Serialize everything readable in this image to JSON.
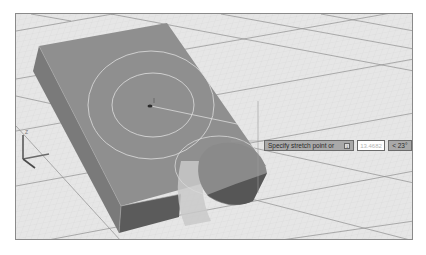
{
  "viewport": {
    "name": "3d-model-viewport",
    "colors": {
      "background": "#e6e6e6",
      "grid_minor": "#d2d2d2",
      "grid_major": "#8c8c8c",
      "block_top": "#8f8f8f",
      "block_side": "#7a7a7a",
      "block_front": "#5e5e5e",
      "selection_circle": "#e0e0e0",
      "cylinder_ghost": "#c4c4c4",
      "tooltip_bg": "#a9a9a9"
    }
  },
  "ucs_icon": {
    "z_label": "Z",
    "x_label": "X",
    "y_label": "Y"
  },
  "dynamic_input": {
    "prompt": "Specify stretch point or",
    "options_icon": "↓",
    "distance_value": "13.4682",
    "angle_value": "< 23°"
  }
}
